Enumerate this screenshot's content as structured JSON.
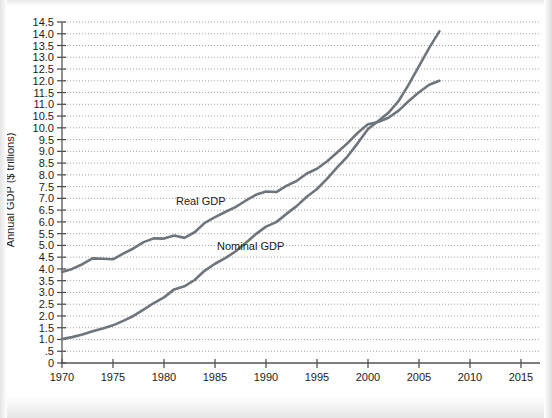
{
  "chart_data": {
    "type": "line",
    "title": "",
    "xlabel": "Year",
    "ylabel": "Annual GDP ($ trillions)",
    "xlim": [
      1970,
      2015
    ],
    "ylim": [
      0,
      14.5
    ],
    "grid": "horizontal-dotted",
    "legend_position": "inline-labels",
    "x_ticks": [
      "1970",
      "1975",
      "1980",
      "1985",
      "1990",
      "1995",
      "2000",
      "2005",
      "2010",
      "2015"
    ],
    "y_ticks": [
      "0",
      ".5",
      "1.0",
      "1.5",
      "2.0",
      "2.5",
      "3.0",
      "3.5",
      "4.0",
      "4.5",
      "5.0",
      "5.5",
      "6.0",
      "6.5",
      "7.0",
      "7.5",
      "8.0",
      "8.5",
      "9.0",
      "9.5",
      "10.0",
      "10.5",
      "11.0",
      "11.5",
      "12.0",
      "12.5",
      "13.0",
      "13.5",
      "14.0",
      "14.5"
    ],
    "x": [
      1970,
      1971,
      1972,
      1973,
      1974,
      1975,
      1976,
      1977,
      1978,
      1979,
      1980,
      1981,
      1982,
      1983,
      1984,
      1985,
      1986,
      1987,
      1988,
      1989,
      1990,
      1991,
      1992,
      1993,
      1994,
      1995,
      1996,
      1997,
      1998,
      1999,
      2000,
      2001,
      2002,
      2003,
      2004,
      2005,
      2006,
      2007
    ],
    "series": [
      {
        "name": "Real GDP",
        "color": "#6e757c",
        "label_x": 1983.6,
        "label_y": 6.7,
        "values": [
          3.87,
          4.0,
          4.2,
          4.45,
          4.43,
          4.41,
          4.65,
          4.87,
          5.14,
          5.3,
          5.29,
          5.42,
          5.32,
          5.56,
          5.96,
          6.2,
          6.42,
          6.63,
          6.9,
          7.15,
          7.29,
          7.27,
          7.53,
          7.74,
          8.06,
          8.26,
          8.58,
          8.96,
          9.35,
          9.79,
          10.15,
          10.25,
          10.43,
          10.73,
          11.14,
          11.51,
          11.83,
          12.0
        ]
      },
      {
        "name": "Nominal GDP",
        "color": "#6e757c",
        "label_x": 1988.5,
        "label_y": 4.8,
        "values": [
          1.02,
          1.1,
          1.21,
          1.35,
          1.47,
          1.6,
          1.79,
          2.0,
          2.27,
          2.55,
          2.79,
          3.13,
          3.26,
          3.53,
          3.93,
          4.22,
          4.46,
          4.74,
          5.1,
          5.48,
          5.8,
          5.99,
          6.34,
          6.67,
          7.07,
          7.4,
          7.84,
          8.33,
          8.79,
          9.35,
          9.95,
          10.29,
          10.64,
          11.14,
          11.85,
          12.62,
          13.4,
          14.1
        ]
      }
    ]
  }
}
